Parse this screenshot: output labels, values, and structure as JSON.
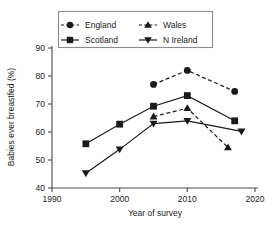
{
  "chart_data": {
    "type": "line",
    "title": "",
    "xlabel": "Year of survey",
    "ylabel": "Babies ever breastfed (%)",
    "xlim": [
      1990,
      2020
    ],
    "ylim": [
      40,
      90
    ],
    "xticks": [
      "1990",
      "2000",
      "2010",
      "2020"
    ],
    "xtick_values": [
      1990,
      2000,
      2010,
      2020
    ],
    "yticks": [
      "40",
      "50",
      "60",
      "70",
      "80",
      "90"
    ],
    "ytick_values": [
      40,
      50,
      60,
      70,
      80,
      90
    ],
    "grid": false,
    "legend_position": "top-center",
    "series": [
      {
        "name": "England",
        "marker": "circle",
        "linestyle": "dashed",
        "color": "#1a1a1a",
        "x": [
          2005,
          2010,
          2017
        ],
        "values": [
          77.0,
          82.0,
          74.5
        ]
      },
      {
        "name": "Scotland",
        "marker": "square",
        "linestyle": "solid",
        "color": "#1a1a1a",
        "x": [
          1995,
          2000,
          2005,
          2010,
          2017
        ],
        "values": [
          55.8,
          62.8,
          69.2,
          73.0,
          64.0
        ]
      },
      {
        "name": "Wales",
        "marker": "triangle-up",
        "linestyle": "dashed",
        "color": "#1a1a1a",
        "x": [
          2005,
          2010,
          2016
        ],
        "values": [
          65.5,
          68.5,
          54.5
        ]
      },
      {
        "name": "N Ireland",
        "marker": "triangle-down",
        "linestyle": "solid",
        "color": "#1a1a1a",
        "x": [
          1995,
          2000,
          2005,
          2010,
          2018
        ],
        "values": [
          45.3,
          53.8,
          63.0,
          64.0,
          60.2
        ]
      }
    ]
  },
  "legend": {
    "entries": [
      {
        "label": "England",
        "marker": "circle",
        "linestyle": "dashed"
      },
      {
        "label": "Wales",
        "marker": "triangle-up",
        "linestyle": "dashed"
      },
      {
        "label": "Scotland",
        "marker": "square",
        "linestyle": "solid"
      },
      {
        "label": "N Ireland",
        "marker": "triangle-down",
        "linestyle": "solid"
      }
    ]
  }
}
